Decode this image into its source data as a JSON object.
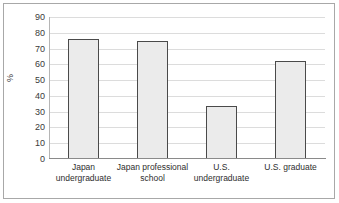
{
  "chart_data": {
    "type": "bar",
    "title": "",
    "subtitle": "",
    "xlabel": "",
    "ylabel": "%",
    "categories": [
      "Japan undergraduate",
      "Japan professional school",
      "U.S. undergraduate",
      "U.S. graduate"
    ],
    "values": [
      76,
      74.5,
      33.5,
      62
    ],
    "ylim": [
      0,
      90
    ],
    "ytick_step": 10,
    "yticks": [
      0,
      10,
      20,
      30,
      40,
      50,
      60,
      70,
      80,
      90
    ],
    "ytick_labels": [
      "0",
      "10",
      "20",
      "30",
      "40",
      "50",
      "60",
      "70",
      "80",
      "90"
    ],
    "grid": true,
    "grid_axis": "y",
    "legend": false,
    "legend_position": "none",
    "annotations": [],
    "series": [
      {
        "name": "",
        "values": [
          76,
          74.5,
          33.5,
          62
        ]
      }
    ],
    "colors": {
      "bar_fill": "#ebebeb",
      "bar_border": "#4a4a4a",
      "gridline": "#dcdcdc",
      "axis": "#8a8a8a",
      "frame": "#a8a8a8",
      "text": "#2e2e2e",
      "background": "#ffffff"
    }
  }
}
